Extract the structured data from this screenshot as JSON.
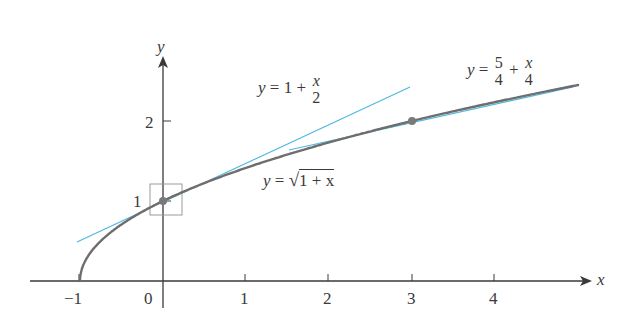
{
  "chart_data": {
    "type": "line",
    "title": "",
    "xlabel": "x",
    "ylabel": "y",
    "xlim": [
      -1.6,
      5.2
    ],
    "ylim": [
      0,
      2.8
    ],
    "grid": false,
    "x_ticks": [
      "-1",
      "0",
      "1",
      "2",
      "3",
      "4"
    ],
    "y_ticks": [
      "1",
      "2"
    ],
    "series": [
      {
        "name": "y = sqrt(1 + x)",
        "type": "curve",
        "color": "#6e6e6e",
        "x": [
          -1,
          -0.75,
          -0.5,
          0,
          0.5,
          1,
          2,
          3,
          4,
          5
        ],
        "y": [
          0,
          0.5,
          0.707,
          1,
          1.225,
          1.414,
          1.732,
          2,
          2.236,
          2.449
        ]
      },
      {
        "name": "y = 1 + x/2",
        "type": "tangent",
        "color": "#4db8e0",
        "x": [
          -1,
          3
        ],
        "y": [
          0.5,
          2.5
        ]
      },
      {
        "name": "y = 5/4 + x/4",
        "type": "tangent",
        "color": "#4db8e0",
        "x": [
          1.5,
          5
        ],
        "y": [
          1.625,
          2.5
        ]
      }
    ],
    "points": [
      {
        "x": 0,
        "y": 1,
        "label": "tangent point"
      },
      {
        "x": 3,
        "y": 2,
        "label": "tangent point"
      }
    ],
    "annotations": [
      {
        "text": "y = 1 + x/2",
        "near": [
          1.5,
          2.3
        ]
      },
      {
        "text": "y = 5/4 + x/4",
        "near": [
          4,
          2.6
        ]
      },
      {
        "text": "y = √(1 + x)",
        "near": [
          2,
          1.2
        ]
      },
      {
        "text": "zoom box around (0,1)",
        "box": [
          -0.2,
          0.8,
          0.2,
          1.2
        ]
      }
    ]
  },
  "axes": {
    "x_label": "x",
    "y_label": "y",
    "x_tick_labels": [
      "−1",
      "0",
      "1",
      "2",
      "3",
      "4"
    ],
    "y_tick_labels": [
      "1",
      "2"
    ]
  },
  "labels": {
    "tangent1": {
      "lhs": "y",
      "eq": " = 1 + ",
      "num": "x",
      "den": "2"
    },
    "tangent2": {
      "lhs": "y",
      "eq": " = ",
      "num1": "5",
      "den1": "4",
      "plus": " + ",
      "num2": "x",
      "den2": "4"
    },
    "curve": {
      "lhs": "y",
      "eq": " = ",
      "radical": "√",
      "body": "1 + x"
    }
  },
  "colors": {
    "curve": "#6e6e6e",
    "tangent": "#4db8e0",
    "axis": "#3a3a3a",
    "point": "#7a7a7a",
    "box": "#9a9a9a"
  }
}
